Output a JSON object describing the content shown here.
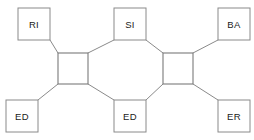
{
  "diagram": {
    "type": "node-link-octagon",
    "canvas": {
      "width": 254,
      "height": 140,
      "background": "#ffffff"
    },
    "colors": {
      "stroke": "#8a8a8a",
      "hub_stroke": "#7a7a7a",
      "fill": "#ffffff",
      "text": "#1a1a1a"
    },
    "hubs": [
      {
        "id": "hub-left",
        "x": 58,
        "y": 53,
        "w": 30,
        "h": 31
      },
      {
        "id": "hub-right",
        "x": 163,
        "y": 53,
        "w": 30,
        "h": 31
      }
    ],
    "nodes": [
      {
        "id": "node-ri",
        "label": "RI",
        "x": 18,
        "y": 8,
        "w": 32,
        "h": 32
      },
      {
        "id": "node-si",
        "label": "SI",
        "x": 114,
        "y": 8,
        "w": 32,
        "h": 32
      },
      {
        "id": "node-ba",
        "label": "BA",
        "x": 218,
        "y": 8,
        "w": 32,
        "h": 32
      },
      {
        "id": "node-ed-left",
        "label": "ED",
        "x": 6,
        "y": 100,
        "w": 32,
        "h": 32
      },
      {
        "id": "node-ed-center",
        "label": "ED",
        "x": 114,
        "y": 100,
        "w": 32,
        "h": 32
      },
      {
        "id": "node-er",
        "label": "ER",
        "x": 218,
        "y": 100,
        "w": 32,
        "h": 32
      }
    ],
    "edges": [
      {
        "id": "edge-ri-hubleft",
        "from": "node-ri",
        "to": "hub-left",
        "x1": 50,
        "y1": 40,
        "x2": 58,
        "y2": 53
      },
      {
        "id": "edge-edleft-hubleft",
        "from": "node-ed-left",
        "to": "hub-left",
        "x1": 38,
        "y1": 100,
        "x2": 58,
        "y2": 84
      },
      {
        "id": "edge-ba-hubright",
        "from": "node-ba",
        "to": "hub-right",
        "x1": 218,
        "y1": 40,
        "x2": 193,
        "y2": 53
      },
      {
        "id": "edge-er-hubright",
        "from": "node-er",
        "to": "hub-right",
        "x1": 218,
        "y1": 100,
        "x2": 193,
        "y2": 84
      },
      {
        "id": "edge-hubleft-si",
        "from": "hub-left",
        "to": "node-si",
        "x1": 88,
        "y1": 53,
        "x2": 114,
        "y2": 40
      },
      {
        "id": "edge-si-hubright",
        "from": "node-si",
        "to": "hub-right",
        "x1": 146,
        "y1": 40,
        "x2": 163,
        "y2": 53
      },
      {
        "id": "edge-hubleft-edcenter",
        "from": "hub-left",
        "to": "node-ed-center",
        "x1": 88,
        "y1": 84,
        "x2": 114,
        "y2": 100
      },
      {
        "id": "edge-edcenter-hubright",
        "from": "node-ed-center",
        "to": "hub-right",
        "x1": 146,
        "y1": 100,
        "x2": 163,
        "y2": 84
      }
    ]
  }
}
